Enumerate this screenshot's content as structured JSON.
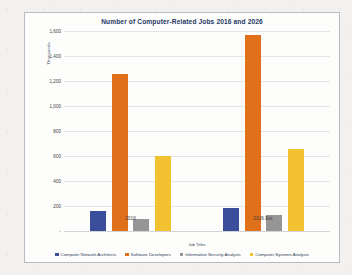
{
  "chart_data": {
    "type": "bar",
    "title": "Number of Computer-Related Jobs 2016 and 2026",
    "xlabel": "Job Titles",
    "ylabel": "Thousands",
    "categories": [
      "2016",
      "2026 Est."
    ],
    "series": [
      {
        "name": "Computer Network Architects",
        "color": "#3B4E9B",
        "values": [
          162,
          186
        ]
      },
      {
        "name": "Software Developers",
        "color": "#E1701A",
        "values": [
          1256,
          1570
        ]
      },
      {
        "name": "Information Security Analysts",
        "color": "#969696",
        "values": [
          100,
          128
        ]
      },
      {
        "name": "Computer Systems Analysts",
        "color": "#F2C230",
        "values": [
          600,
          660
        ]
      }
    ],
    "ylim": [
      0,
      1600
    ],
    "yticks": [
      0,
      200,
      400,
      600,
      800,
      1000,
      1200,
      1400,
      1600
    ],
    "ytick_labels": [
      "-",
      "200",
      "400",
      "600",
      "800",
      "1,000",
      "1,200",
      "1,400",
      "1,600"
    ],
    "grid": true,
    "legend_position": "bottom"
  }
}
